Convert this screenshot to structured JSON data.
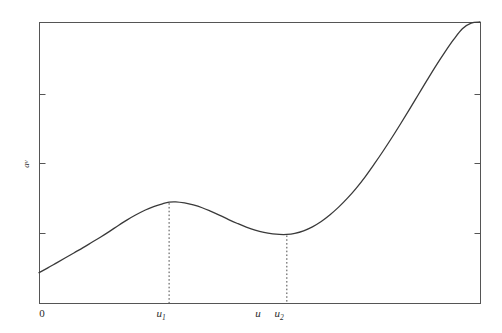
{
  "chart_data": {
    "type": "line",
    "title": "",
    "xlabel": "",
    "ylabel": "a_v",
    "ylabel_base": "a",
    "ylabel_sub": "v",
    "grid": false,
    "legend": null,
    "xlim": [
      0,
      10
    ],
    "ylim": [
      0,
      10
    ],
    "axis_origin_label": "0",
    "x_tick_labels": [
      {
        "id": "u1",
        "base": "u",
        "sub": "1",
        "x_pixel": 161,
        "x_value": 2.95
      },
      {
        "id": "u",
        "base": "u",
        "sub": "",
        "x_pixel": 258,
        "x_value": 5.15
      },
      {
        "id": "u2",
        "base": "u",
        "sub": "2",
        "x_pixel": 279,
        "x_value": 5.62
      }
    ],
    "dropline_x_values": [
      2.95,
      5.62
    ],
    "annotations": [
      {
        "label": "local maximum at u1",
        "x": 2.95,
        "y": 3.59
      },
      {
        "label": "local minimum at u2",
        "x": 5.62,
        "y": 2.45
      }
    ],
    "series": [
      {
        "name": "a_v(u)",
        "color": "#3a3a3a",
        "x": [
          0.0,
          0.2,
          0.4,
          0.6,
          0.8,
          1.0,
          1.2,
          1.4,
          1.6,
          1.8,
          2.0,
          2.2,
          2.4,
          2.6,
          2.8,
          2.95,
          3.1,
          3.3,
          3.5,
          3.7,
          3.9,
          4.1,
          4.3,
          4.5,
          4.7,
          4.9,
          5.1,
          5.3,
          5.45,
          5.62,
          5.8,
          6.0,
          6.2,
          6.4,
          6.6,
          6.8,
          7.0,
          7.2,
          7.4,
          7.6,
          7.8,
          8.0,
          8.2,
          8.4,
          8.6,
          8.8,
          9.0,
          9.2,
          9.4,
          9.6,
          9.8,
          10.0
        ],
        "y": [
          1.08,
          1.25,
          1.43,
          1.61,
          1.79,
          1.97,
          2.16,
          2.35,
          2.55,
          2.76,
          2.96,
          3.14,
          3.3,
          3.43,
          3.53,
          3.59,
          3.6,
          3.56,
          3.49,
          3.39,
          3.26,
          3.12,
          2.97,
          2.83,
          2.7,
          2.59,
          2.51,
          2.46,
          2.44,
          2.44,
          2.48,
          2.57,
          2.71,
          2.9,
          3.14,
          3.42,
          3.74,
          4.1,
          4.5,
          4.94,
          5.4,
          5.88,
          6.38,
          6.89,
          7.41,
          7.93,
          8.44,
          8.92,
          9.37,
          9.76,
          9.96,
          10.0
        ]
      }
    ],
    "frame": {
      "left_px": 39,
      "top_px": 22,
      "right_px": 480,
      "bottom_px": 303,
      "color": "#555555"
    },
    "y_ticks_pixels": [
      94,
      163,
      233
    ],
    "curve_endpoints": {
      "start": {
        "x_pixel": 40,
        "y_pixel": 272
      },
      "end": {
        "x_pixel": 480,
        "y_pixel": 23
      }
    }
  }
}
